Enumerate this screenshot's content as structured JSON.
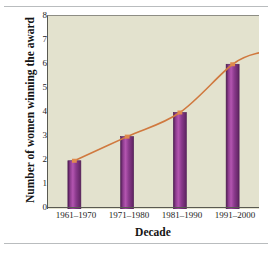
{
  "chart_data": {
    "type": "bar",
    "title": "",
    "subtitle": "",
    "xlabel": "Decade",
    "ylabel": "Number of women winning the award",
    "categories": [
      "1961–1970",
      "1971–1980",
      "1981–1990",
      "1991–2000"
    ],
    "values": [
      2,
      3,
      4,
      6
    ],
    "ylim": [
      0,
      8
    ],
    "yticks": [
      0,
      1,
      2,
      3,
      4,
      5,
      6,
      7,
      8
    ],
    "ytick_labels": [
      "0",
      "1",
      "2",
      "3",
      "4",
      "5",
      "6",
      "7",
      "8"
    ],
    "grid": false,
    "legend": null,
    "legend_position": "none",
    "overlay": {
      "type": "line",
      "name": "trend curve",
      "color": "#d0793f",
      "points": [
        {
          "x": 0,
          "y": 2.0
        },
        {
          "x": 1,
          "y": 3.0
        },
        {
          "x": 2,
          "y": 4.0
        },
        {
          "x": 3,
          "y": 6.0
        }
      ],
      "extends_past_last_point_to": 6.5
    },
    "colors": {
      "plot_background": "#e3e2ce",
      "page_background": "#ffffff",
      "bar_fill_dark": "#6a2a6d",
      "bar_fill_light": "#b355b0",
      "bar_edge": "#4e1c52",
      "line": "#d0793f",
      "axis": "#3a3a34",
      "text": "#141414",
      "rule": "#b9bcbe"
    }
  }
}
